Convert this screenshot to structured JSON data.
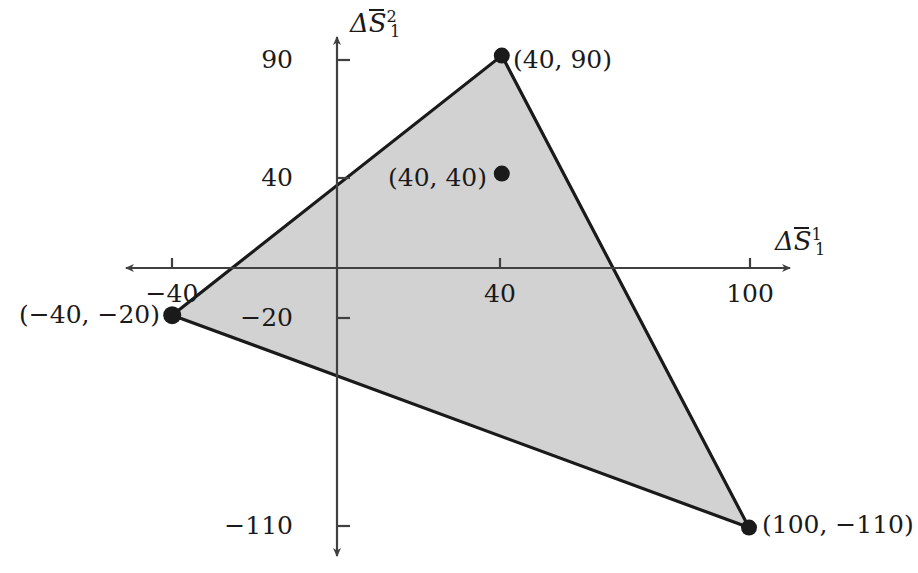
{
  "figure": {
    "title": "",
    "background_color": "#ffffff",
    "region_fill_color": "#d2d2d2",
    "line_color": "#1a1a1a",
    "axis_color": "#404040"
  },
  "axes": {
    "x": {
      "label_text": "ΔS̄₁¹",
      "label_parts": {
        "delta": "Δ",
        "symbol": "S",
        "superscript": "1",
        "subscript": "1"
      },
      "ticks": [
        {
          "value": -40,
          "label": "−40"
        },
        {
          "value": 40,
          "label": "40"
        },
        {
          "value": 100,
          "label": "100"
        }
      ],
      "arrows": "both",
      "range": [
        -52,
        118
      ]
    },
    "y": {
      "label_text": "ΔS̄₁²",
      "label_parts": {
        "delta": "Δ",
        "symbol": "S",
        "superscript": "2",
        "subscript": "1"
      },
      "ticks": [
        {
          "value": 90,
          "label": "90"
        },
        {
          "value": 40,
          "label": "40"
        },
        {
          "value": -20,
          "label": "−20"
        },
        {
          "value": -110,
          "label": "−110"
        }
      ],
      "arrows": "both",
      "range": [
        -125,
        102
      ]
    }
  },
  "chart_data": {
    "type": "scatter",
    "title": "",
    "xlabel": "ΔS̄₁¹",
    "ylabel": "ΔS̄₁²",
    "xlim": [
      -52,
      118
    ],
    "ylim": [
      -125,
      102
    ],
    "grid": false,
    "legend": "none",
    "xticks": [
      -40,
      40,
      100
    ],
    "xticklabels": [
      "−40",
      "40",
      "100"
    ],
    "yticks": [
      90,
      40,
      -20,
      -110
    ],
    "yticklabels": [
      "90",
      "40",
      "−20",
      "−110"
    ],
    "region": {
      "name": "feasible-triangle",
      "fill": "#d2d2d2",
      "stroke": "#1a1a1a",
      "vertices": [
        {
          "x": 40,
          "y": 90,
          "label": "(40, 90)",
          "label_position": "right"
        },
        {
          "x": 100,
          "y": -110,
          "label": "(100, −110)",
          "label_position": "right"
        },
        {
          "x": -40,
          "y": -20,
          "label": "(−40, −20)",
          "label_position": "left"
        }
      ]
    },
    "points": [
      {
        "x": 40,
        "y": 90,
        "label": "(40, 90)",
        "label_position": "right",
        "marker": "filled-circle"
      },
      {
        "x": 40,
        "y": 40,
        "label": "(40, 40)",
        "label_position": "left",
        "marker": "filled-circle"
      },
      {
        "x": -40,
        "y": -20,
        "label": "(−40, −20)",
        "label_position": "left",
        "marker": "filled-circle"
      },
      {
        "x": 100,
        "y": -110,
        "label": "(100, −110)",
        "label_position": "right",
        "marker": "filled-circle"
      }
    ]
  },
  "labels": {
    "vertex_top": "(40, 90)",
    "interior_point": "(40, 40)",
    "vertex_left": "(−40, −20)",
    "vertex_bottom_right": "(100, −110)",
    "tick_y_90": "90",
    "tick_y_40": "40",
    "tick_y_minus20": "−20",
    "tick_y_minus110": "−110",
    "tick_x_minus40": "−40",
    "tick_x_40": "40",
    "tick_x_100": "100"
  }
}
